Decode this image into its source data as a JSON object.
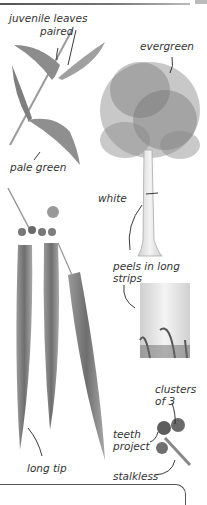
{
  "plate": {
    "subject": "eucalyptus",
    "labels": {
      "juvenile_1": "juvenile leaves",
      "juvenile_2": "paired",
      "pale_green": "pale green",
      "evergreen": "evergreen",
      "white": "white",
      "peels_1": "peels in long",
      "peels_2": "strips",
      "long_tip": "long tip",
      "clusters_1": "clusters",
      "clusters_2": "of 3",
      "teeth_1": "teeth",
      "teeth_2": "project",
      "stalkless": "stalkless"
    }
  },
  "colors": {
    "ink": "#333333",
    "leaf": "#8a8a8a",
    "leaf_dark": "#5e5e5e",
    "bark": "#e6e6e6"
  }
}
